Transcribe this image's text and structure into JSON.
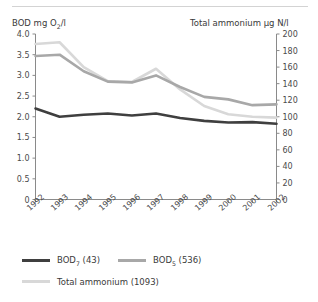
{
  "chart_data": {
    "type": "line",
    "title": "",
    "ylabel": "BOD mg O2/l",
    "ylabel_prefix": "BOD mg O",
    "ylabel_sub": "2",
    "ylabel_suffix": "/l",
    "y2label": "Total ammonium µg N/l",
    "xlabel": "",
    "grid": false,
    "legend_position": "bottom",
    "categories": [
      "1992",
      "1993",
      "1994",
      "1995",
      "1996",
      "1997",
      "1998",
      "1999",
      "2000",
      "2001",
      "2002"
    ],
    "ylim": [
      0,
      4.0
    ],
    "y2lim": [
      0,
      200
    ],
    "yticks": [
      "0",
      "0.5",
      "1.0",
      "1.5",
      "2.0",
      "2.5",
      "3.0",
      "3.5",
      "4.0"
    ],
    "ytick_values": [
      0,
      0.5,
      1.0,
      1.5,
      2.0,
      2.5,
      3.0,
      3.5,
      4.0
    ],
    "y2ticks": [
      "0",
      "20",
      "40",
      "60",
      "80",
      "100",
      "120",
      "140",
      "160",
      "180",
      "200"
    ],
    "y2tick_values": [
      0,
      20,
      40,
      60,
      80,
      100,
      120,
      140,
      160,
      180,
      200
    ],
    "series": [
      {
        "name": "BOD7 (43)",
        "label_prefix": "BOD",
        "label_sub": "7",
        "label_suffix": " (43)",
        "axis": "left",
        "color": "#3f3f3f",
        "width": 2.6,
        "values": [
          2.2,
          2.0,
          2.05,
          2.08,
          2.03,
          2.08,
          1.97,
          1.9,
          1.86,
          1.87,
          1.83
        ]
      },
      {
        "name": "BOD5 (536)",
        "label_prefix": "BOD",
        "label_sub": "5",
        "label_suffix": " (536)",
        "axis": "left",
        "color": "#a8a8a8",
        "width": 2.6,
        "values": [
          3.47,
          3.5,
          3.1,
          2.85,
          2.83,
          3.0,
          2.72,
          2.48,
          2.42,
          2.28,
          2.3
        ]
      },
      {
        "name": "Total ammonium (1093)",
        "label_prefix": "Total ammonium (1093)",
        "label_sub": "",
        "label_suffix": "",
        "axis": "right",
        "color": "#d8d8d8",
        "width": 2.6,
        "values": [
          188,
          190,
          160,
          143,
          142,
          158,
          133,
          113,
          103,
          100,
          99
        ]
      }
    ]
  },
  "legend": {
    "rows": [
      [
        "BOD7 (43)",
        "BOD5 (536)"
      ],
      [
        "Total ammonium (1093)"
      ]
    ]
  },
  "colors": {
    "bod7": "#3f3f3f",
    "bod5": "#a8a8a8",
    "ammonium": "#d8d8d8",
    "axis": "#8a8a8a",
    "text": "#3a3a3a"
  }
}
